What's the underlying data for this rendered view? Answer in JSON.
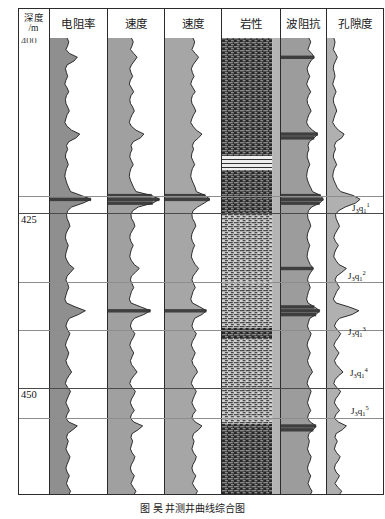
{
  "figure": {
    "caption": "图     吴  井测井曲线综合图",
    "width": 385,
    "height": 519
  },
  "header": {
    "columns": [
      {
        "id": "depth",
        "label_line1": "深度",
        "label_line2": "/m",
        "x": 18,
        "w": 32
      },
      {
        "id": "resistivity",
        "label": "电阻率",
        "x": 50,
        "w": 58
      },
      {
        "id": "velocity1",
        "label": "速度",
        "x": 108,
        "w": 57
      },
      {
        "id": "velocity2",
        "label": "速度",
        "x": 165,
        "w": 57
      },
      {
        "id": "lithology",
        "label": "岩性",
        "x": 222,
        "w": 59
      },
      {
        "id": "impedance",
        "label": "波阻抗",
        "x": 281,
        "w": 46
      },
      {
        "id": "porosity",
        "label": "孔隙度",
        "x": 327,
        "w": 57
      }
    ]
  },
  "depth_axis": {
    "unit": "m",
    "top_value": "400",
    "ticks": [
      {
        "label": "425",
        "y": 213
      },
      {
        "label": "450",
        "y": 388
      }
    ],
    "range_top": 400,
    "range_bottom": 458
  },
  "gridlines": [
    {
      "y": 196,
      "strong": false
    },
    {
      "y": 213,
      "strong": true
    },
    {
      "y": 282,
      "strong": false
    },
    {
      "y": 330,
      "strong": false
    },
    {
      "y": 388,
      "strong": true
    },
    {
      "y": 418,
      "strong": false
    }
  ],
  "strat_labels": [
    {
      "base": "J",
      "sub": "3",
      "unit": "q",
      "unit_sub": "1",
      "sup": "1",
      "x": 352,
      "y": 201
    },
    {
      "base": "J",
      "sub": "3",
      "unit": "q",
      "unit_sub": "1",
      "sup": "2",
      "x": 348,
      "y": 269
    },
    {
      "base": "J",
      "sub": "3",
      "unit": "q",
      "unit_sub": "1",
      "sup": "3",
      "x": 348,
      "y": 325
    },
    {
      "base": "J",
      "sub": "3",
      "unit": "q",
      "unit_sub": "1",
      "sup": "4",
      "x": 350,
      "y": 366
    },
    {
      "base": "J",
      "sub": "3",
      "unit": "q",
      "unit_sub": "1",
      "sup": "5",
      "x": 351,
      "y": 404
    }
  ],
  "colors": {
    "curve_fill_light": "#a8a8a8",
    "curve_fill_dark": "#3d3d3d",
    "curve_line": "#1b1b1b",
    "frame": "#2b2b2b",
    "grid": "#8d8d8d",
    "lithology_mudstone": "#2a2a2a",
    "lithology_sandstone": "#c9c9c9",
    "background": "#ffffff"
  },
  "chart_data": {
    "type": "line",
    "xlabel": "",
    "ylabel": "深度 /m",
    "ylim": [
      400,
      458
    ],
    "grid": true,
    "legend": "none",
    "note": "Seven vertical log tracks plotted against depth; curve traces are shaded left-fill.",
    "tracks": [
      {
        "name": "电阻率",
        "id": "resistivity",
        "fill": "#8f8f8f",
        "samples": [
          0.3,
          0.33,
          0.31,
          0.28,
          0.34,
          0.48,
          0.42,
          0.3,
          0.27,
          0.29,
          0.31,
          0.28,
          0.26,
          0.3,
          0.33,
          0.29,
          0.27,
          0.28,
          0.31,
          0.34,
          0.3,
          0.28,
          0.26,
          0.3,
          0.38,
          0.52,
          0.46,
          0.33,
          0.29,
          0.31,
          0.28,
          0.27,
          0.3,
          0.32,
          0.29,
          0.27,
          0.26,
          0.28,
          0.3,
          0.33,
          0.36,
          0.55,
          0.72,
          0.58,
          0.38,
          0.31,
          0.29,
          0.3,
          0.33,
          0.35,
          0.31,
          0.28,
          0.27,
          0.29,
          0.32,
          0.3,
          0.28,
          0.27,
          0.3,
          0.34,
          0.42,
          0.36,
          0.3,
          0.28,
          0.31,
          0.33,
          0.3,
          0.28,
          0.26,
          0.29,
          0.44,
          0.62,
          0.5,
          0.34,
          0.3,
          0.28,
          0.31,
          0.35,
          0.32,
          0.29,
          0.27,
          0.3,
          0.33,
          0.31,
          0.28,
          0.3,
          0.34,
          0.38,
          0.33,
          0.29,
          0.27,
          0.31,
          0.36,
          0.33,
          0.3,
          0.28,
          0.31,
          0.34,
          0.3,
          0.28,
          0.33,
          0.48,
          0.4,
          0.31,
          0.29,
          0.32,
          0.3,
          0.28,
          0.31,
          0.35,
          0.33,
          0.3,
          0.28,
          0.3,
          0.34,
          0.31,
          0.29,
          0.32,
          0.36,
          0.33
        ]
      },
      {
        "name": "速度",
        "id": "velocity1",
        "fill": "#a0a0a0",
        "samples": [
          0.42,
          0.45,
          0.43,
          0.4,
          0.46,
          0.52,
          0.47,
          0.42,
          0.39,
          0.41,
          0.44,
          0.4,
          0.38,
          0.42,
          0.46,
          0.41,
          0.39,
          0.4,
          0.44,
          0.47,
          0.43,
          0.4,
          0.38,
          0.42,
          0.5,
          0.64,
          0.58,
          0.45,
          0.41,
          0.43,
          0.4,
          0.39,
          0.42,
          0.45,
          0.41,
          0.39,
          0.38,
          0.4,
          0.43,
          0.46,
          0.5,
          0.78,
          0.92,
          0.8,
          0.54,
          0.44,
          0.41,
          0.42,
          0.46,
          0.48,
          0.44,
          0.4,
          0.39,
          0.41,
          0.45,
          0.42,
          0.4,
          0.39,
          0.42,
          0.47,
          0.56,
          0.49,
          0.42,
          0.4,
          0.43,
          0.46,
          0.42,
          0.4,
          0.38,
          0.41,
          0.58,
          0.76,
          0.64,
          0.47,
          0.42,
          0.4,
          0.43,
          0.48,
          0.45,
          0.41,
          0.39,
          0.42,
          0.46,
          0.43,
          0.4,
          0.42,
          0.47,
          0.52,
          0.46,
          0.41,
          0.39,
          0.43,
          0.49,
          0.46,
          0.42,
          0.4,
          0.43,
          0.47,
          0.42,
          0.4,
          0.46,
          0.62,
          0.54,
          0.43,
          0.41,
          0.44,
          0.42,
          0.4,
          0.43,
          0.48,
          0.46,
          0.42,
          0.4,
          0.42,
          0.47,
          0.44,
          0.41,
          0.45,
          0.5,
          0.46
        ]
      },
      {
        "name": "速度",
        "id": "velocity2",
        "fill": "#a6a6a6",
        "samples": [
          0.5,
          0.53,
          0.51,
          0.48,
          0.54,
          0.6,
          0.55,
          0.5,
          0.47,
          0.49,
          0.52,
          0.48,
          0.46,
          0.5,
          0.54,
          0.49,
          0.47,
          0.48,
          0.52,
          0.55,
          0.51,
          0.48,
          0.46,
          0.5,
          0.56,
          0.66,
          0.6,
          0.52,
          0.49,
          0.51,
          0.48,
          0.47,
          0.5,
          0.53,
          0.49,
          0.47,
          0.46,
          0.48,
          0.51,
          0.54,
          0.56,
          0.72,
          0.8,
          0.7,
          0.58,
          0.5,
          0.48,
          0.49,
          0.53,
          0.55,
          0.51,
          0.48,
          0.47,
          0.49,
          0.53,
          0.5,
          0.48,
          0.47,
          0.5,
          0.54,
          0.6,
          0.55,
          0.5,
          0.48,
          0.51,
          0.54,
          0.5,
          0.48,
          0.46,
          0.49,
          0.62,
          0.74,
          0.66,
          0.53,
          0.5,
          0.48,
          0.51,
          0.56,
          0.53,
          0.49,
          0.47,
          0.5,
          0.54,
          0.51,
          0.48,
          0.5,
          0.55,
          0.58,
          0.53,
          0.49,
          0.47,
          0.51,
          0.56,
          0.53,
          0.5,
          0.48,
          0.51,
          0.55,
          0.5,
          0.48,
          0.54,
          0.66,
          0.6,
          0.51,
          0.49,
          0.52,
          0.5,
          0.48,
          0.51,
          0.56,
          0.54,
          0.5,
          0.48,
          0.5,
          0.55,
          0.52,
          0.49,
          0.53,
          0.58,
          0.54
        ]
      },
      {
        "name": "波阻抗",
        "id": "impedance",
        "fill": "#9c9c9c",
        "samples": [
          0.62,
          0.66,
          0.63,
          0.6,
          0.68,
          0.74,
          0.66,
          0.61,
          0.58,
          0.6,
          0.64,
          0.6,
          0.57,
          0.61,
          0.66,
          0.61,
          0.58,
          0.59,
          0.63,
          0.67,
          0.62,
          0.59,
          0.57,
          0.61,
          0.7,
          0.82,
          0.74,
          0.63,
          0.6,
          0.62,
          0.59,
          0.58,
          0.61,
          0.64,
          0.6,
          0.58,
          0.57,
          0.59,
          0.62,
          0.66,
          0.7,
          0.88,
          0.94,
          0.86,
          0.68,
          0.61,
          0.59,
          0.6,
          0.64,
          0.66,
          0.62,
          0.59,
          0.58,
          0.6,
          0.64,
          0.61,
          0.59,
          0.58,
          0.61,
          0.65,
          0.72,
          0.66,
          0.61,
          0.59,
          0.62,
          0.65,
          0.61,
          0.59,
          0.57,
          0.6,
          0.74,
          0.86,
          0.78,
          0.64,
          0.61,
          0.59,
          0.62,
          0.67,
          0.64,
          0.6,
          0.58,
          0.61,
          0.65,
          0.62,
          0.59,
          0.61,
          0.66,
          0.7,
          0.64,
          0.6,
          0.58,
          0.62,
          0.67,
          0.64,
          0.61,
          0.59,
          0.62,
          0.66,
          0.61,
          0.59,
          0.65,
          0.78,
          0.72,
          0.62,
          0.6,
          0.63,
          0.61,
          0.59,
          0.62,
          0.67,
          0.65,
          0.61,
          0.59,
          0.61,
          0.66,
          0.63,
          0.6,
          0.64,
          0.69,
          0.65
        ]
      },
      {
        "name": "孔隙度",
        "id": "porosity",
        "fill": "#b0b0b0",
        "samples": [
          0.12,
          0.14,
          0.13,
          0.11,
          0.15,
          0.18,
          0.15,
          0.12,
          0.11,
          0.13,
          0.14,
          0.12,
          0.1,
          0.13,
          0.16,
          0.13,
          0.11,
          0.12,
          0.15,
          0.17,
          0.14,
          0.12,
          0.1,
          0.14,
          0.2,
          0.3,
          0.26,
          0.16,
          0.13,
          0.15,
          0.12,
          0.11,
          0.14,
          0.17,
          0.13,
          0.11,
          0.1,
          0.12,
          0.15,
          0.18,
          0.24,
          0.46,
          0.58,
          0.5,
          0.32,
          0.2,
          0.15,
          0.16,
          0.19,
          0.22,
          0.18,
          0.14,
          0.12,
          0.15,
          0.2,
          0.16,
          0.13,
          0.12,
          0.16,
          0.21,
          0.34,
          0.26,
          0.17,
          0.14,
          0.18,
          0.22,
          0.17,
          0.14,
          0.11,
          0.16,
          0.38,
          0.56,
          0.44,
          0.22,
          0.16,
          0.13,
          0.18,
          0.24,
          0.2,
          0.15,
          0.12,
          0.16,
          0.21,
          0.17,
          0.13,
          0.16,
          0.22,
          0.28,
          0.2,
          0.14,
          0.12,
          0.17,
          0.24,
          0.2,
          0.15,
          0.13,
          0.17,
          0.22,
          0.16,
          0.13,
          0.2,
          0.34,
          0.27,
          0.16,
          0.14,
          0.18,
          0.15,
          0.13,
          0.17,
          0.23,
          0.2,
          0.15,
          0.13,
          0.16,
          0.22,
          0.18,
          0.14,
          0.19,
          0.26,
          0.21
        ]
      }
    ],
    "lithology_intervals": [
      {
        "pattern": "mudstone",
        "from_y": 0,
        "to_y": 118,
        "label": "泥岩"
      },
      {
        "pattern": "interbed",
        "from_y": 118,
        "to_y": 132,
        "label": "互层"
      },
      {
        "pattern": "mudstone",
        "from_y": 132,
        "to_y": 176,
        "label": "泥岩"
      },
      {
        "pattern": "sandstone",
        "from_y": 176,
        "to_y": 290,
        "label": "砂岩"
      },
      {
        "pattern": "mudstone",
        "from_y": 290,
        "to_y": 300,
        "label": "泥岩"
      },
      {
        "pattern": "sandstone",
        "from_y": 300,
        "to_y": 386,
        "label": "砂岩"
      },
      {
        "pattern": "mudstone",
        "from_y": 386,
        "to_y": 457,
        "label": "泥岩"
      }
    ]
  }
}
